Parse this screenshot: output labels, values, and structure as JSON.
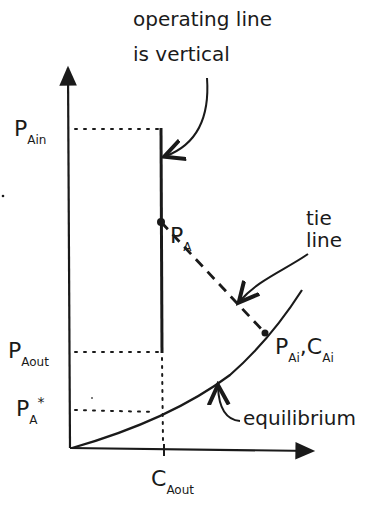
{
  "annotations": {
    "operating_line": [
      "operating line",
      "is vertical"
    ],
    "tie_line": [
      "tie",
      "line"
    ],
    "equilibrium": "equilibrium"
  },
  "labels": {
    "p_ain": {
      "main": "P",
      "sub": "Ain"
    },
    "p_aout": {
      "main": "P",
      "sub": "Aout"
    },
    "p_a_star": {
      "main": "P",
      "sub": "A",
      "sup": "*"
    },
    "p_a": {
      "main": "P",
      "sub": "A"
    },
    "p_ai_c_ai": {
      "main1": "P",
      "sub1": "Ai",
      "sep": ",",
      "main2": "C",
      "sub2": "Ai"
    },
    "c_aout": {
      "main": "C",
      "sub": "Aout"
    }
  },
  "colors": {
    "ink": "#1a1a1a",
    "background": "#ffffff"
  }
}
